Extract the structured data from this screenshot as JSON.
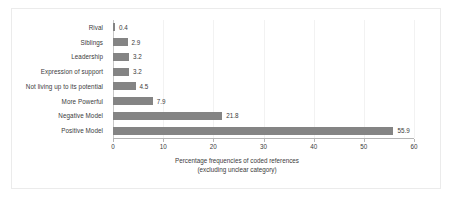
{
  "chart_data": {
    "type": "bar",
    "orientation": "horizontal",
    "title": "",
    "subtitle": "",
    "xlabel_line1": "Percentage frequencies of coded references",
    "xlabel_line2": "(excluding unclear category)",
    "ylabel": "",
    "categories": [
      "Rival",
      "Siblings",
      "Leadership",
      "Expression of support",
      "Not living up to its potential",
      "More Powerful",
      "Negative Model",
      "Positive Model"
    ],
    "values": [
      0.4,
      2.9,
      3.2,
      3.2,
      4.5,
      7.9,
      21.8,
      55.9
    ],
    "value_labels": [
      "0.4",
      "2.9",
      "3.2",
      "3.2",
      "4.5",
      "7.9",
      "21.8",
      "55.9"
    ],
    "xlim": [
      0,
      60
    ],
    "xticks": [
      0,
      10,
      20,
      30,
      40,
      50,
      60
    ],
    "xticklabels": [
      "0",
      "10",
      "20",
      "30",
      "40",
      "50",
      "60"
    ],
    "grid": "vertical-light",
    "legend": "none",
    "bar_color": "#848484",
    "text_color": "#3b3b3b",
    "axis_color": "#b5b5b5",
    "gridline_color": "#f2f2f2",
    "frame_color": "#ebebeb",
    "background": "#ffffff"
  }
}
